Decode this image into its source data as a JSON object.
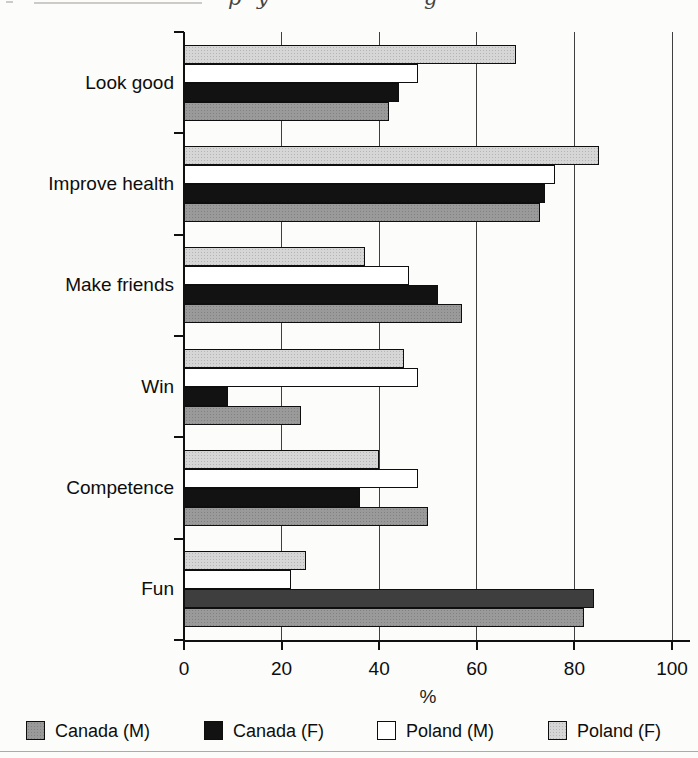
{
  "chart_data": {
    "type": "bar",
    "orientation": "horizontal",
    "categories": [
      "Look good",
      "Improve health",
      "Make friends",
      "Win",
      "Competence",
      "Fun"
    ],
    "series": [
      {
        "name": "Canada (M)",
        "color": "#9a9a9a",
        "halftone": true,
        "values": [
          42,
          73,
          57,
          24,
          50,
          82
        ]
      },
      {
        "name": "Canada (F)",
        "color": "#121212",
        "halftone": false,
        "values": [
          44,
          74,
          52,
          9,
          36,
          84
        ]
      },
      {
        "name": "Poland (M)",
        "color": "#ffffff",
        "halftone": false,
        "values": [
          48,
          76,
          46,
          48,
          48,
          22
        ]
      },
      {
        "name": "Poland (F)",
        "color": "#d6d6d6",
        "halftone": true,
        "values": [
          68,
          85,
          37,
          45,
          40,
          25
        ]
      }
    ],
    "bar_order_top_to_bottom": [
      "Poland (F)",
      "Poland (M)",
      "Canada (F)",
      "Canada (M)"
    ],
    "xlabel": "%",
    "xlim": [
      0,
      100
    ],
    "x_ticks": [
      0,
      20,
      40,
      60,
      80,
      100
    ],
    "x_tick_labels": [
      "0",
      "20",
      "40",
      "60",
      "80",
      "100"
    ],
    "grid": true,
    "legend_position": "bottom",
    "color_overrides": [
      {
        "series": "Canada (F)",
        "category": "Fun",
        "color": "#3e3e3e"
      }
    ]
  },
  "top_fragment": {
    "glyphs": [
      {
        "char": "p",
        "x": 228
      },
      {
        "char": "y",
        "x": 257
      },
      {
        "char": "g",
        "x": 424
      }
    ]
  },
  "colors": {
    "axis": "#101010",
    "gridline": "#3f3f3f",
    "background": "#fcfcfa",
    "bottom_rule": "#ababab"
  }
}
